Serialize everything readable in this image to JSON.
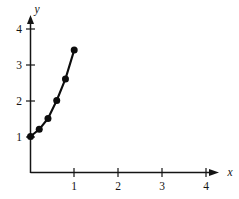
{
  "chart_data": {
    "type": "line",
    "title": "",
    "xlabel": "x",
    "ylabel": "y",
    "xlim": [
      0,
      4.35
    ],
    "ylim": [
      0,
      4.4
    ],
    "xticks": [
      1,
      2,
      3,
      4
    ],
    "yticks": [
      1,
      2,
      3,
      4
    ],
    "xtick_labels": [
      "1",
      "2",
      "3",
      "4"
    ],
    "ytick_labels": [
      "1",
      "2",
      "3",
      "4"
    ],
    "grid": false,
    "legend": null,
    "markers": "filled-circle",
    "series": [
      {
        "name": "curve",
        "x": [
          0,
          0.2,
          0.4,
          0.6,
          0.8,
          1.0
        ],
        "y": [
          1.0,
          1.2,
          1.5,
          2.0,
          2.6,
          3.4
        ]
      }
    ]
  },
  "axes": {
    "x_axis_name": "x",
    "y_axis_name": "y",
    "x_arrow": "arrow-right-icon",
    "y_arrow": "arrow-up-icon"
  },
  "style": {
    "background": "#ffffff",
    "ink": "#141414",
    "data_color": "#0d0d0d"
  }
}
